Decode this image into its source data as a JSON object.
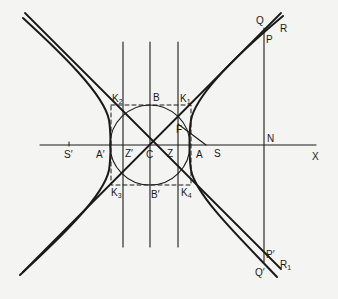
{
  "diagram": {
    "type": "rectangular-hyperbola-construction",
    "colors": {
      "background": "#f4f4f2",
      "ink": "#1a1a1a"
    },
    "labels": {
      "Q": "Q",
      "R": "R",
      "P": "P",
      "N": "N",
      "X": "X",
      "K2": "K",
      "K2_sub": "2",
      "K1": "K",
      "K1_sub": "1",
      "K3": "K",
      "K3_sub": "3",
      "K4": "K",
      "K4_sub": "4",
      "B": "B",
      "B_prime": "B′",
      "F": "F",
      "S_prime": "S′",
      "A_prime": "A′",
      "Z_prime": "Z′",
      "C": "C",
      "Z": "Z",
      "A": "A",
      "S": "S",
      "P_prime": "P′",
      "Q_prime": "Q′",
      "R1": "R",
      "R1_sub": "1"
    },
    "elements": [
      "hyperbola-two-branches",
      "asymptotes-two-diagonals",
      "auxiliary-circle",
      "dashed-rectangle-K1K2K3K4",
      "directrices-vertical-lines-through-Z-and-Z-prime",
      "conjugate-axis-vertical-through-C",
      "transverse-axis-S-prime-to-X",
      "ordinate-PN-extended-to-P-prime",
      "line-F-to-S"
    ]
  }
}
